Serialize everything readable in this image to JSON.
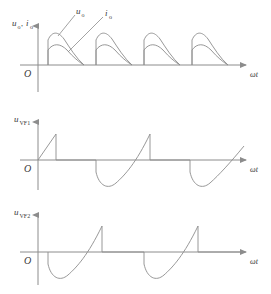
{
  "figure": {
    "name": "thyristor-rectifier-waveforms",
    "background": "#ffffff",
    "line_color": "#8c8c8c",
    "axis_color": "#8c8c8c",
    "text_color": "#3a3a3a",
    "width": 271,
    "height": 294
  },
  "panels": [
    {
      "id": "panel-uo-io",
      "y_label": "uₒ, iₒ",
      "y_label_parts": [
        {
          "base": "u",
          "sub": "o"
        },
        {
          "base": "i",
          "sub": "o"
        }
      ],
      "origin_label": "O",
      "x_label": "ωt",
      "annotations": [
        {
          "name": "uo-callout",
          "text": "uₒ",
          "base": "u",
          "sub": "o"
        },
        {
          "name": "io-callout",
          "text": "iₒ",
          "base": "i",
          "sub": "o"
        }
      ],
      "baseline_y": 65,
      "axis_x": 38,
      "axis_top": 21,
      "axis_bottom": 92,
      "axis_right": 252,
      "pulse_count": 4,
      "pulse_period": 48,
      "pulse_start_offset": 10,
      "pulse_conduction_width": 36,
      "uo_peak": 34,
      "io_peak": 22
    },
    {
      "id": "panel-uvf1",
      "y_label": "u_VF1",
      "y_label_parts": [
        {
          "base": "u",
          "sub": "VF1"
        }
      ],
      "origin_label": "O",
      "x_label": "ωt",
      "baseline_y": 160,
      "axis_x": 38,
      "axis_top": 117,
      "axis_bottom": 190,
      "axis_right": 252,
      "ramp_peak": 27,
      "dip_depth": 28,
      "period": 96,
      "phase": "ramp-first"
    },
    {
      "id": "panel-uvf2",
      "y_label": "u_VF2",
      "y_label_parts": [
        {
          "base": "u",
          "sub": "VF2"
        }
      ],
      "origin_label": "O",
      "x_label": "ωt",
      "baseline_y": 252,
      "axis_x": 38,
      "axis_top": 210,
      "axis_bottom": 285,
      "axis_right": 252,
      "ramp_peak": 27,
      "dip_depth": 28,
      "period": 96,
      "phase": "dip-first"
    }
  ],
  "labels": {
    "uo_base": "u",
    "uo_sub": "o",
    "io_base": "i",
    "io_sub": "o",
    "comma": ",",
    "uvf1_base": "u",
    "uvf1_sub": "VF1",
    "uvf2_base": "u",
    "uvf2_sub": "VF2",
    "origin": "O",
    "omega_t": "ωt"
  }
}
